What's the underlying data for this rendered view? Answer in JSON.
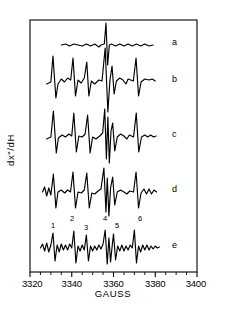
{
  "figure": {
    "width": 227,
    "height": 325,
    "background": "#ffffff",
    "ink": "#000000"
  },
  "axes": {
    "x_title": "GAUSS",
    "y_title": "dx\"/dH",
    "x_tick_labels": [
      "3320",
      "3340",
      "3360",
      "3380",
      "3400"
    ],
    "x_tick_values": [
      3320,
      3340,
      3360,
      3380,
      3400
    ],
    "x_min": 3320,
    "x_max": 3400,
    "minor_tick_step": 5,
    "frame_left": 30,
    "frame_right": 197,
    "frame_top": 20,
    "frame_bottom": 272
  },
  "traces": [
    {
      "label": "a",
      "label_x": 172,
      "label_y": 45,
      "baseline": 45
    },
    {
      "label": "b",
      "label_x": 172,
      "label_y": 82,
      "baseline": 82
    },
    {
      "label": "c",
      "label_x": 172,
      "label_y": 137,
      "baseline": 137
    },
    {
      "label": "d",
      "label_x": 172,
      "label_y": 192,
      "baseline": 192
    },
    {
      "label": "e",
      "label_x": 172,
      "label_y": 248,
      "baseline": 248
    }
  ],
  "peak_numbers": [
    {
      "label": "1",
      "x": 53,
      "y": 228
    },
    {
      "label": "2",
      "x": 72,
      "y": 221
    },
    {
      "label": "3",
      "x": 86,
      "y": 230
    },
    {
      "label": "4",
      "x": 105,
      "y": 221
    },
    {
      "label": "5",
      "x": 117,
      "y": 228
    },
    {
      "label": "6",
      "x": 140,
      "y": 221
    }
  ],
  "chart_data": {
    "type": "line",
    "title": "",
    "xlabel": "GAUSS",
    "ylabel": "dx\"/dH",
    "xlim": [
      3320,
      3400
    ],
    "grid": false,
    "legend": "inline-right",
    "series": [
      {
        "name": "a",
        "baseline_y": 45,
        "amplitude_scale": 1.0,
        "points": [
          [
            3335,
            0
          ],
          [
            3337,
            1
          ],
          [
            3339,
            -1
          ],
          [
            3341,
            1
          ],
          [
            3343,
            0
          ],
          [
            3345,
            -1
          ],
          [
            3347,
            1
          ],
          [
            3349,
            -1
          ],
          [
            3351,
            1
          ],
          [
            3353,
            -2
          ],
          [
            3354,
            0
          ],
          [
            3355.6,
            1
          ],
          [
            3356.4,
            22
          ],
          [
            3357.2,
            -20
          ],
          [
            3358,
            0
          ],
          [
            3359,
            1
          ],
          [
            3361,
            -1
          ],
          [
            3363,
            1
          ],
          [
            3365,
            -1
          ],
          [
            3367,
            1
          ],
          [
            3369,
            -1
          ],
          [
            3371,
            1
          ],
          [
            3373,
            -1
          ],
          [
            3375,
            1
          ],
          [
            3377,
            -1
          ],
          [
            3379,
            0
          ]
        ]
      },
      {
        "name": "b",
        "baseline_y": 82,
        "amplitude_scale": 1.0,
        "points": [
          [
            3328,
            -2
          ],
          [
            3330,
            0
          ],
          [
            3331,
            26
          ],
          [
            3332.4,
            -16
          ],
          [
            3333.4,
            -2
          ],
          [
            3335,
            3
          ],
          [
            3336.5,
            0
          ],
          [
            3338,
            4
          ],
          [
            3339.5,
            2
          ],
          [
            3340.6,
            24
          ],
          [
            3341.8,
            -14
          ],
          [
            3343,
            2
          ],
          [
            3344.5,
            -1
          ],
          [
            3346,
            4
          ],
          [
            3347.2,
            20
          ],
          [
            3348.2,
            -14
          ],
          [
            3349.4,
            1
          ],
          [
            3351,
            -2
          ],
          [
            3353,
            2
          ],
          [
            3354.5,
            1
          ],
          [
            3356,
            34
          ],
          [
            3357.3,
            -30
          ],
          [
            3358.3,
            2
          ],
          [
            3359.3,
            16
          ],
          [
            3360.3,
            -12
          ],
          [
            3361.4,
            1
          ],
          [
            3363,
            4
          ],
          [
            3364.5,
            2
          ],
          [
            3366,
            -2
          ],
          [
            3367,
            3
          ],
          [
            3369.5,
            1
          ],
          [
            3370.8,
            24
          ],
          [
            3372,
            -14
          ],
          [
            3373.2,
            0
          ],
          [
            3375,
            3
          ],
          [
            3377,
            2
          ],
          [
            3378.5,
            3
          ],
          [
            3380,
            1
          ]
        ]
      },
      {
        "name": "c",
        "baseline_y": 137,
        "amplitude_scale": 1.0,
        "points": [
          [
            3328,
            -2
          ],
          [
            3330,
            0
          ],
          [
            3331.2,
            26
          ],
          [
            3332.6,
            -16
          ],
          [
            3333.6,
            -1
          ],
          [
            3335.4,
            2
          ],
          [
            3337,
            0
          ],
          [
            3338.6,
            3
          ],
          [
            3340,
            1
          ],
          [
            3341,
            24
          ],
          [
            3342.2,
            -15
          ],
          [
            3343.4,
            1
          ],
          [
            3345,
            0
          ],
          [
            3346.4,
            3
          ],
          [
            3347.6,
            22
          ],
          [
            3348.8,
            -16
          ],
          [
            3350,
            0
          ],
          [
            3351.6,
            -2
          ],
          [
            3353.4,
            1
          ],
          [
            3354.8,
            4
          ],
          [
            3355.8,
            28
          ],
          [
            3356.6,
            -22
          ],
          [
            3357.3,
            20
          ],
          [
            3358,
            -26
          ],
          [
            3358.8,
            6
          ],
          [
            3359.6,
            14
          ],
          [
            3360.6,
            -14
          ],
          [
            3361.8,
            0
          ],
          [
            3363.4,
            3
          ],
          [
            3365,
            1
          ],
          [
            3366.4,
            -2
          ],
          [
            3367.6,
            2
          ],
          [
            3369.6,
            0
          ],
          [
            3370.9,
            24
          ],
          [
            3372.1,
            -15
          ],
          [
            3373.4,
            0
          ],
          [
            3375,
            2
          ],
          [
            3376.4,
            0
          ],
          [
            3377.8,
            2
          ],
          [
            3379.2,
            0
          ],
          [
            3380.4,
            1
          ]
        ]
      },
      {
        "name": "d",
        "baseline_y": 192,
        "amplitude_scale": 1.0,
        "points": [
          [
            3326,
            0
          ],
          [
            3327,
            5
          ],
          [
            3328,
            -4
          ],
          [
            3329,
            4
          ],
          [
            3330,
            -3
          ],
          [
            3331.2,
            18
          ],
          [
            3332.4,
            -16
          ],
          [
            3333.4,
            0
          ],
          [
            3335,
            2
          ],
          [
            3336.6,
            -1
          ],
          [
            3338,
            2
          ],
          [
            3339.4,
            0
          ],
          [
            3340.6,
            20
          ],
          [
            3341.8,
            -16
          ],
          [
            3343,
            0
          ],
          [
            3344.6,
            -1
          ],
          [
            3346,
            2
          ],
          [
            3347.2,
            19
          ],
          [
            3348.4,
            -16
          ],
          [
            3349.6,
            -1
          ],
          [
            3351,
            -2
          ],
          [
            3352.6,
            1
          ],
          [
            3354,
            3
          ],
          [
            3355.4,
            24
          ],
          [
            3356.4,
            -20
          ],
          [
            3357,
            14
          ],
          [
            3357.8,
            -24
          ],
          [
            3358.6,
            4
          ],
          [
            3359.6,
            15
          ],
          [
            3360.6,
            -13
          ],
          [
            3361.8,
            0
          ],
          [
            3363.4,
            2
          ],
          [
            3365,
            0
          ],
          [
            3366.4,
            -2
          ],
          [
            3367.8,
            1
          ],
          [
            3369.6,
            0
          ],
          [
            3370.8,
            20
          ],
          [
            3372,
            -16
          ],
          [
            3373.2,
            -1
          ],
          [
            3374.6,
            3
          ],
          [
            3375.8,
            -2
          ],
          [
            3377,
            3
          ],
          [
            3378.2,
            -2
          ],
          [
            3379.4,
            2
          ],
          [
            3380.6,
            0
          ]
        ]
      },
      {
        "name": "e",
        "baseline_y": 248,
        "amplitude_scale": 1.0,
        "points": [
          [
            3325,
            0
          ],
          [
            3326,
            4
          ],
          [
            3327,
            -3
          ],
          [
            3328,
            5
          ],
          [
            3329,
            -4
          ],
          [
            3330,
            3
          ],
          [
            3331,
            15
          ],
          [
            3332,
            -13
          ],
          [
            3333,
            3
          ],
          [
            3334,
            -4
          ],
          [
            3335,
            4
          ],
          [
            3336,
            -2
          ],
          [
            3337,
            3
          ],
          [
            3338,
            -2
          ],
          [
            3339,
            4
          ],
          [
            3340,
            0
          ],
          [
            3341,
            17
          ],
          [
            3342,
            -15
          ],
          [
            3343,
            2
          ],
          [
            3344,
            -3
          ],
          [
            3345,
            3
          ],
          [
            3346,
            -2
          ],
          [
            3347,
            13
          ],
          [
            3348,
            -13
          ],
          [
            3349,
            2
          ],
          [
            3350,
            -3
          ],
          [
            3351,
            2
          ],
          [
            3352,
            -2
          ],
          [
            3353,
            3
          ],
          [
            3354,
            -1
          ],
          [
            3355,
            4
          ],
          [
            3356,
            18
          ],
          [
            3357,
            -16
          ],
          [
            3357.8,
            10
          ],
          [
            3358.6,
            -14
          ],
          [
            3359.4,
            3
          ],
          [
            3360,
            14
          ],
          [
            3361,
            -12
          ],
          [
            3362,
            2
          ],
          [
            3363,
            -3
          ],
          [
            3364,
            3
          ],
          [
            3365,
            -3
          ],
          [
            3366,
            2
          ],
          [
            3367,
            -2
          ],
          [
            3368,
            3
          ],
          [
            3369,
            0
          ],
          [
            3370,
            18
          ],
          [
            3371,
            -15
          ],
          [
            3372,
            2
          ],
          [
            3373,
            -4
          ],
          [
            3374,
            3
          ],
          [
            3375,
            -2
          ],
          [
            3376,
            3
          ],
          [
            3377,
            -2
          ],
          [
            3378,
            2
          ],
          [
            3379,
            -1
          ],
          [
            3380,
            2
          ],
          [
            3381,
            0
          ],
          [
            3382,
            1
          ]
        ]
      }
    ],
    "annotated_peaks": {
      "series": "e",
      "labels": [
        "1",
        "2",
        "3",
        "4",
        "5",
        "6"
      ],
      "field_values": [
        3331,
        3341,
        3347,
        3356,
        3360,
        3370
      ]
    }
  }
}
